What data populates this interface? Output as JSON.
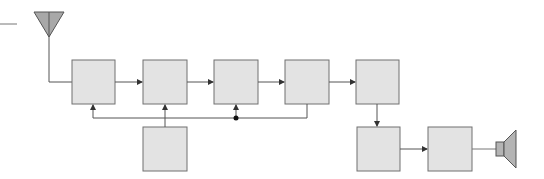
{
  "diagram": {
    "type": "block-diagram",
    "colors": {
      "box_fill": "#e3e3e3",
      "box_stroke": "#707070",
      "line": "#555555",
      "antenna_fill": "#a8a8a8",
      "speaker_fill": "#b4b4b4",
      "background": "#ffffff"
    },
    "nodes": [
      {
        "id": "antenna",
        "kind": "antenna-icon",
        "label": ""
      },
      {
        "id": "block-1",
        "kind": "block",
        "label": ""
      },
      {
        "id": "block-2",
        "kind": "block",
        "label": ""
      },
      {
        "id": "block-3",
        "kind": "block",
        "label": ""
      },
      {
        "id": "block-4",
        "kind": "block",
        "label": ""
      },
      {
        "id": "block-5",
        "kind": "block",
        "label": ""
      },
      {
        "id": "block-lower",
        "kind": "block",
        "label": ""
      },
      {
        "id": "block-6",
        "kind": "block",
        "label": ""
      },
      {
        "id": "block-7",
        "kind": "block",
        "label": ""
      },
      {
        "id": "speaker",
        "kind": "speaker-icon",
        "label": ""
      }
    ],
    "edges": [
      {
        "from": "antenna",
        "to": "block-1"
      },
      {
        "from": "block-1",
        "to": "block-2",
        "arrow": true
      },
      {
        "from": "block-2",
        "to": "block-3",
        "arrow": true
      },
      {
        "from": "block-3",
        "to": "block-4",
        "arrow": true
      },
      {
        "from": "block-4",
        "to": "block-5",
        "arrow": true
      },
      {
        "from": "block-5",
        "to": "block-6",
        "arrow": true
      },
      {
        "from": "block-6",
        "to": "block-7",
        "arrow": true
      },
      {
        "from": "block-7",
        "to": "speaker"
      },
      {
        "from": "block-lower",
        "to": "block-2",
        "arrow": true
      },
      {
        "from": "block-4",
        "to": "feedback-bus"
      },
      {
        "from": "feedback-bus",
        "to": "block-1",
        "arrow": true
      },
      {
        "from": "feedback-junction",
        "to": "block-3",
        "arrow": true
      }
    ]
  }
}
